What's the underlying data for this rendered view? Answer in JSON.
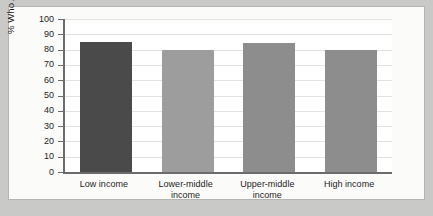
{
  "chart_data": {
    "type": "bar",
    "title": "",
    "xlabel": "",
    "ylabel": "% Who Are Inactive",
    "categories": [
      "Low income",
      "Lower-middle\nincome",
      "Upper-middle\nincome",
      "High income"
    ],
    "values": [
      85,
      80,
      84,
      80
    ],
    "ylim": [
      0,
      100
    ],
    "ytick_labels": [
      "100",
      "90",
      "80",
      "70",
      "60",
      "50",
      "40",
      "30",
      "20",
      "10",
      "0"
    ],
    "ytick_values": [
      100,
      90,
      80,
      70,
      60,
      50,
      40,
      30,
      20,
      10,
      0
    ],
    "grid": true,
    "legend": "none",
    "bar_colors": [
      "#4a4a4a",
      "#9d9d9d",
      "#8d8d8d",
      "#8d8d8d"
    ],
    "axis_color": "#6b6b6b",
    "gridline_color": "#e2e2e0",
    "plot_background": "#ffffff",
    "panel_background": "#fbfbfa",
    "page_background": "#c9c9c7"
  }
}
